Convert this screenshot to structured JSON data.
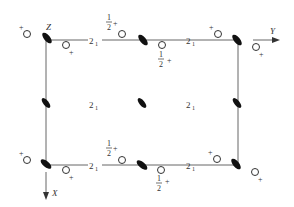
{
  "diagram": {
    "type": "space-group-symmetry-diagram",
    "axes": {
      "z_label": "Z",
      "y_label": "Y",
      "x_label": "X"
    },
    "screw_axis_label": "2",
    "screw_axis_subscript": "1",
    "half_label": {
      "num": "1",
      "den": "2"
    },
    "plus_sign": "+",
    "colors": {
      "line": "#555555",
      "symbol": "#111111",
      "text": "#333333",
      "background": "#ffffff"
    }
  }
}
